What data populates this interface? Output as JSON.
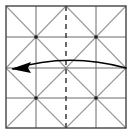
{
  "figure": {
    "kind": "origami-crease-pattern-diagram",
    "canvas": {
      "width": 134,
      "height": 140
    },
    "colors": {
      "background": "#ffffff",
      "border": "#444444",
      "grid": "#6b6b6b",
      "crease_diagonal": "#9a9a9a",
      "fold_line_dashed": "#3a3a3a",
      "arrow": "#000000"
    },
    "square": {
      "label": "paper-square",
      "x": 6,
      "y": 6,
      "width": 120,
      "height": 122,
      "stroke_width": 1.4
    },
    "grid_lines": {
      "label": "quarter-grid",
      "vertical_x": [
        36,
        96
      ],
      "horizontal_y": [
        37,
        98
      ],
      "center_horizontal_y": 68,
      "stroke_width": 1
    },
    "center_fold": {
      "label": "vertical-valley-fold",
      "x": 66,
      "y1": 6,
      "y2": 128,
      "dash": "5,4",
      "stroke_width": 1.5
    },
    "diagonal_creases": {
      "label": "alternating-cell-diagonals",
      "cell_cols_x": [
        6,
        36,
        66,
        96,
        126
      ],
      "cell_rows_y": [
        6,
        37,
        68,
        98,
        128
      ],
      "pattern": "checkerboard",
      "stroke_width": 1.1,
      "segments": [
        {
          "x1": 6,
          "y1": 6,
          "x2": 36,
          "y2": 37
        },
        {
          "x1": 66,
          "y1": 6,
          "x2": 36,
          "y2": 37
        },
        {
          "x1": 66,
          "y1": 6,
          "x2": 96,
          "y2": 37
        },
        {
          "x1": 126,
          "y1": 6,
          "x2": 96,
          "y2": 37
        },
        {
          "x1": 6,
          "y1": 68,
          "x2": 36,
          "y2": 37
        },
        {
          "x1": 66,
          "y1": 68,
          "x2": 36,
          "y2": 37
        },
        {
          "x1": 66,
          "y1": 68,
          "x2": 96,
          "y2": 37
        },
        {
          "x1": 126,
          "y1": 68,
          "x2": 96,
          "y2": 37
        },
        {
          "x1": 6,
          "y1": 68,
          "x2": 36,
          "y2": 98
        },
        {
          "x1": 66,
          "y1": 68,
          "x2": 36,
          "y2": 98
        },
        {
          "x1": 66,
          "y1": 68,
          "x2": 96,
          "y2": 98
        },
        {
          "x1": 126,
          "y1": 68,
          "x2": 96,
          "y2": 98
        },
        {
          "x1": 6,
          "y1": 128,
          "x2": 36,
          "y2": 98
        },
        {
          "x1": 66,
          "y1": 128,
          "x2": 36,
          "y2": 98
        },
        {
          "x1": 66,
          "y1": 128,
          "x2": 96,
          "y2": 98
        },
        {
          "x1": 126,
          "y1": 128,
          "x2": 96,
          "y2": 98
        }
      ]
    },
    "fold_arrow": {
      "label": "fold-right-edge-to-left-edge",
      "direction": "right-to-left",
      "start_x": 126,
      "start_y": 68,
      "end_x": 13,
      "end_y": 69,
      "control_x": 68,
      "control_y": 52,
      "stroke_width": 1.6,
      "arrowhead": {
        "tip_x": 11,
        "tip_y": 69,
        "points": "11,69 31,62 28,68 31,73"
      }
    },
    "vertex_dots": {
      "label": "crease-intersection-dots",
      "radius": 1.8,
      "points": [
        {
          "x": 36,
          "y": 37
        },
        {
          "x": 96,
          "y": 37
        },
        {
          "x": 36,
          "y": 98
        },
        {
          "x": 96,
          "y": 98
        }
      ]
    }
  }
}
